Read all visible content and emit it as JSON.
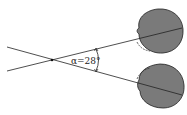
{
  "diagram": {
    "angle_label": "α=28°",
    "colors": {
      "eye_fill": "#7a7a7a",
      "stroke": "#222222",
      "background": "#ffffff"
    }
  }
}
